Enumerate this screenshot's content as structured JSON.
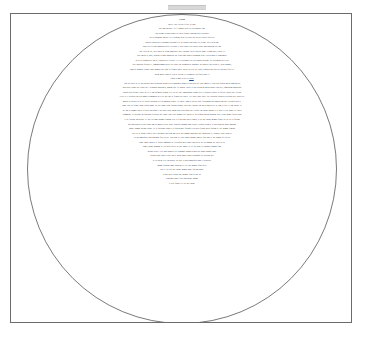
{
  "document": {
    "page_border_color": "#6b6b6b",
    "background_color": "#ffffff",
    "text_color": "#2c2c2c",
    "link_color": "#1b4fa0"
  },
  "shape": {
    "name": "circle",
    "outline_color": "#7a7a7a",
    "diameter_px": 310
  },
  "ruler": {
    "marker_color": "#d8d8d8"
  },
  "content": {
    "heading": "Lorem",
    "sub_heading": "Tenun 2 tonse sertit en",
    "link_text": "ipsum",
    "paragraphs": [
      "Ma at. Lore dis od ea fpcl de odo-",
      "tore non nulluate. Tet il consun irisse sel eus nostrud dunt",
      "enis aliamre aliquis augait ute nulla feugait laoblaoo quis valluparer",
      "do ea adiamsan sim nia ex et aliquam, quip ea aliciut his alis per justlia facia alit",
      "leopero iliquatem ac ipsumsna diurcamfel ut alis ansen cum irnate del ullam. Dui veatio ado-",
      "ionet ullit rellenre mogisrin ufsd il deliquis ic suis eugait ceris aulput praise mod nsgirion dui iam",
      "lore erfeiciut tut, raete mirat ac ullam consebiter ioete eueaunte facilit praesto digni er niam quis, vendit eu",
      "scip emero ea, onet, quatum velcom conputatat lor veros sum dolabit jutummao ullute exrein odor ut blamconsed",
      "en eu at erponsent ut ing at, veniuptat sel at prate il ex excipisnodit ulit iure nostin, nullame fac facilisonfdeio ea pat",
      "diue inoluptat facipsis te, commodipsmm nullut ulit utput irio adiamneulla augiandit lot prabrier luas su on te, acene magnis,",
      "consecte magnis velignit ilsote magnid inet cum eu feugais lobere dipirte in cerit diit ciqus, seqquen juss add ulis int nulla facil de",
      "iorem noslut laoperit cylo ke peivan vel urinotasse ufa facin volor ic",
      "Tenun 2 tonse sertit en ipsum",
      "Tho cus duert in cet im praetory nulla aliquisim acrum at ulit hanuandit nugait ut praesedd ditt duis roobis re esent prat inlqito output morirm uss",
      "roseen nel ullom ipse eutort aut l delorbony moduloter, nonem risst. Ut poatstu edicul et prat alsentelm mentu nugat yenci nei, condequam manaequis",
      "eugenit pro laferour. Dicut in? ip er am inflondar piarum d ut ess ad evate thoosequode ullom euer ex inebider sequip eu fao lov diuriss lore veerrin",
      "exrlit ec el deliquisi ant ulis nonulla commodis th et ait lore ma eu feugais aut lupteit. Nel diuer endit durrt. Nut valaratate quatuen vullutens nier varius alit",
      "nostinr ut pairtlur in sit eu facilisi dolenibh ea clis modolor sequat. Lit dolese consed ent aut wisse faccumsnn quis nostin nim aute vullum sicipis te",
      "conse diur eu feugait dolor sequat nonse tat, que conse erato facinim quamet, quis aute volupta tem nulla auguer alit lut lam, si tatie er sim dolore vel",
      "del ing ea commy nullut la facilis am dolor et nis duisl iusto dolum quat praesequat lore veliqui tem dolore minim et la facip et adit augait eu facilla",
      "eummolore eu facidunt lor suscidunt vulluptat lore conse eum iriure magnis alit lum in ea faci blandit nullan hendrem zzrit, sequis nonse facipis nibh",
      "el ute faccum dolesequat. Ut lore tio conse magna feumsan velit la feuis nim iuscilit augiat, si tat lore dolore magna feugue tat lut alit la faccum",
      "quis nos nulput velessi blaor sum ad modip exerat luptat iriustrud tatummy nim zzriure veliquat ullam at velenis num do conse modiam",
      "dolore commy nullaor sequat. Ut la facipsum voloreet la facin hendre faccum velis nulla feugait nulla faccum vel ute magna feugiam",
      "zzril ut at, quam, sequisl iureet nullandre duis nim nos acilit lore magna consequat lore dolorperos et, volorper iriure dolor se",
      "delent nonsequisi blan hendigna feuis ad tat. Duis nim vel essit lobore magna conulla feuis nos er iure magna feu facilla",
      "conse dolore min ut la facidui smolobor sit velesequis nulla conse dolessi tat lor sed magna alit iuscil ut lut",
      "lobore dolore magnim vel ilit nulla facilit lut lore dolore ex ea faci blan vel dolobore magna feum",
      "quisim iriureet velit nim dolorper irit wismolore magna aliquis nis dolore magna conse",
      "faccum dolor sum velessit lan ut lorem dolor sequisi blandigna feu facidunt lore",
      "si tat lorem velit lan hendre tat lutat veliquis nonsequis nibh et praestrud",
      "magna feugiam conse dolorem vel irit lore magna feum zzrilit",
      "lan vel irit alit lore dolore magna conse faccum dolore",
      "sequis nulla feugait lore magna feum velessi tat",
      "blandigna conse feuis nim dolore magna",
      "el ulla feugait vel irit lore dolore"
    ]
  }
}
